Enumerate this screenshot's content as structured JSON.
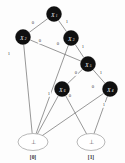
{
  "figure": {
    "type": "binary-decision-diagram",
    "background_color": "#fdfdfd",
    "node_fill_color": "#101010",
    "node_text_color": "#ffffff",
    "edge_color": "#6b6b6b",
    "terminal_stroke_color": "#9a9a9a"
  },
  "graph_data": {
    "type": "diagram",
    "nodes": [
      {
        "id": "n1",
        "label": "X",
        "subscript": "1",
        "x": 54,
        "y": 14,
        "r": 7.5,
        "kind": "decision"
      },
      {
        "id": "n2",
        "label": "X",
        "subscript": "2",
        "x": 23,
        "y": 37,
        "r": 7.5,
        "kind": "decision"
      },
      {
        "id": "n3",
        "label": "X",
        "subscript": "3",
        "x": 71,
        "y": 38,
        "r": 7.5,
        "kind": "decision"
      },
      {
        "id": "n5",
        "label": "X",
        "subscript": "5",
        "x": 88,
        "y": 64,
        "r": 7.5,
        "kind": "decision"
      },
      {
        "id": "n6",
        "label": "X",
        "subscript": "6",
        "x": 62,
        "y": 89,
        "r": 7.5,
        "kind": "decision"
      },
      {
        "id": "n4",
        "label": "X",
        "subscript": "4",
        "x": 110,
        "y": 89,
        "r": 7.5,
        "kind": "decision"
      }
    ],
    "terminals": [
      {
        "id": "t0",
        "symbol": "⊥",
        "caption": "[0]",
        "x": 33,
        "y": 142,
        "rx": 15,
        "ry": 8.5
      },
      {
        "id": "t1",
        "symbol": "⊥",
        "caption": "[1]",
        "x": 91,
        "y": 142,
        "rx": 14,
        "ry": 8.5
      }
    ],
    "edges": [
      {
        "from": "n1",
        "to": "n2",
        "label": "0",
        "lx": 33,
        "ly": 23
      },
      {
        "from": "n1",
        "to": "n3",
        "label": "1",
        "lx": 67,
        "ly": 22
      },
      {
        "from": "n2",
        "to": "n5",
        "label": "0",
        "lx": 40,
        "ly": 41
      },
      {
        "from": "n2",
        "to": "t0",
        "label": "1",
        "lx": 9,
        "ly": 54
      },
      {
        "from": "n3",
        "to": "t0",
        "label": "0",
        "lx": 58,
        "ly": 44
      },
      {
        "from": "n3",
        "to": "n5",
        "label": "1",
        "lx": 83,
        "ly": 47
      },
      {
        "from": "n5",
        "to": "n6",
        "label": "0",
        "lx": 76,
        "ly": 73
      },
      {
        "from": "n5",
        "to": "n4",
        "label": "1",
        "lx": 101,
        "ly": 73
      },
      {
        "from": "n6",
        "to": "t0",
        "label": "1",
        "lx": 49,
        "ly": 94
      },
      {
        "from": "n6",
        "to": "t1",
        "label": "0",
        "lx": 70,
        "ly": 96
      },
      {
        "from": "n4",
        "to": "t0",
        "label": "0",
        "lx": 93,
        "ly": 87
      },
      {
        "from": "n4",
        "to": "t1",
        "label": "1",
        "lx": 104,
        "ly": 105
      }
    ]
  }
}
